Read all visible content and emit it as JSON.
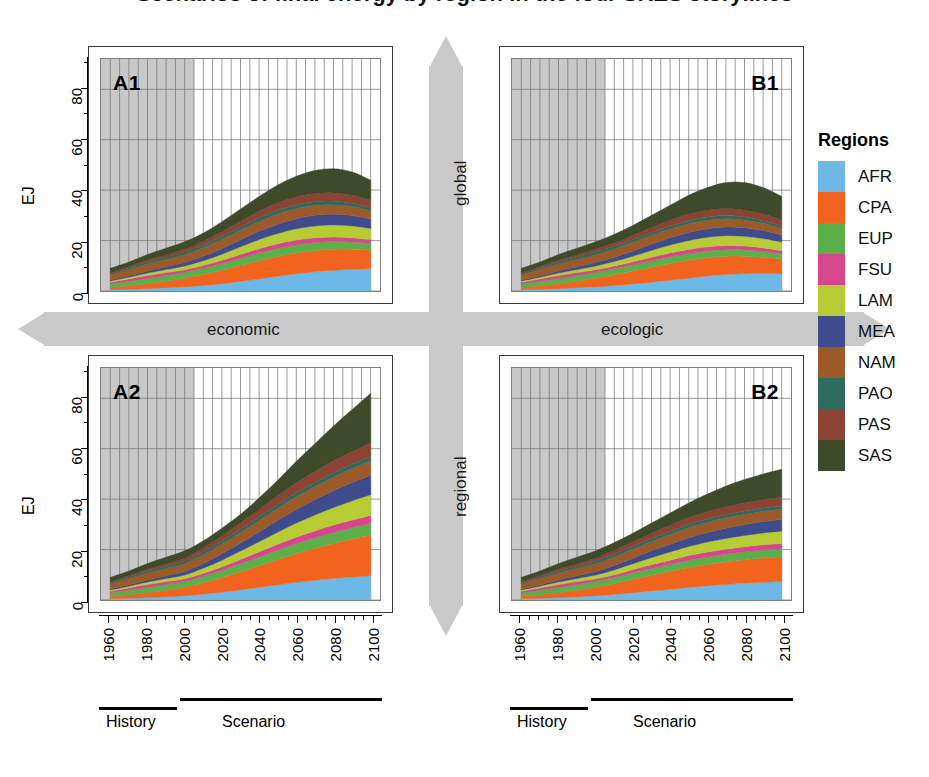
{
  "figure": {
    "title_cropped": "Scenarios of final energy by region in the four SRES storylines",
    "y_axis_label": "EJ",
    "y_ticks": [
      0,
      20,
      40,
      60,
      80
    ],
    "y_minor_ticks": [
      10,
      30,
      50,
      70,
      90
    ],
    "y_range": [
      0,
      92
    ],
    "x_ticks": [
      "1960",
      "1980",
      "2000",
      "2020",
      "2040",
      "2060",
      "2080",
      "2100"
    ],
    "x_range": [
      1955,
      2105
    ],
    "history_end_year": 2005,
    "period_labels": {
      "history": "History",
      "scenario": "Scenario"
    }
  },
  "axes_arrows": {
    "horizontal_left": "economic",
    "horizontal_right": "ecologic",
    "vertical_top": "global",
    "vertical_bottom": "regional",
    "arrow_color": "#c9c9c9"
  },
  "legend": {
    "title": "Regions",
    "items": [
      {
        "code": "AFR",
        "color": "#6cb8e6"
      },
      {
        "code": "CPA",
        "color": "#f2641e"
      },
      {
        "code": "EUP",
        "color": "#5cae48"
      },
      {
        "code": "FSU",
        "color": "#d6468c"
      },
      {
        "code": "LAM",
        "color": "#b7cc34"
      },
      {
        "code": "MEA",
        "color": "#3e4c8e"
      },
      {
        "code": "NAM",
        "color": "#9c5a2a"
      },
      {
        "code": "PAO",
        "color": "#2d6b5e"
      },
      {
        "code": "PAS",
        "color": "#8b4433"
      },
      {
        "code": "SAS",
        "color": "#3f4a2a"
      }
    ]
  },
  "panels": [
    {
      "id": "A1",
      "label": "A1",
      "position": "top-left"
    },
    {
      "id": "B1",
      "label": "B1",
      "position": "top-right"
    },
    {
      "id": "A2",
      "label": "A2",
      "position": "bottom-left"
    },
    {
      "id": "B2",
      "label": "B2",
      "position": "bottom-right"
    }
  ],
  "chart_data": {
    "type": "area",
    "xlabel": "",
    "ylabel": "EJ",
    "ylim": [
      0,
      92
    ],
    "xlim": [
      1955,
      2105
    ],
    "grid": true,
    "legend_position": "right",
    "stacked": true,
    "x": [
      1960,
      1970,
      1980,
      1990,
      2000,
      2010,
      2020,
      2030,
      2040,
      2050,
      2060,
      2070,
      2080,
      2090,
      2100
    ],
    "region_order": [
      "AFR",
      "CPA",
      "EUP",
      "FSU",
      "LAM",
      "MEA",
      "NAM",
      "PAO",
      "PAS",
      "SAS"
    ],
    "panels": [
      {
        "id": "A1",
        "label": "A1",
        "scenario_axes": {
          "x": "economic",
          "y": "global"
        },
        "total_values": [
          9.0,
          11.5,
          14.5,
          17.0,
          19.5,
          23.0,
          27.5,
          32.5,
          37.5,
          42.0,
          45.5,
          47.8,
          48.5,
          47.2,
          44.0
        ],
        "series": [
          {
            "name": "AFR",
            "values": [
              0.5,
              0.7,
              1.0,
              1.3,
              1.7,
              2.2,
              2.9,
              3.8,
              4.8,
              5.8,
              6.8,
              7.6,
              8.2,
              8.6,
              8.8
            ]
          },
          {
            "name": "CPA",
            "values": [
              1.0,
              1.4,
              1.9,
              2.6,
              3.4,
              4.3,
              5.3,
              6.3,
              7.2,
              7.9,
              8.3,
              8.5,
              8.4,
              8.0,
              7.4
            ]
          },
          {
            "name": "EUP",
            "values": [
              1.4,
              1.8,
              2.1,
              2.2,
              2.3,
              2.5,
              2.7,
              2.9,
              3.1,
              3.2,
              3.2,
              3.1,
              3.0,
              2.8,
              2.6
            ]
          },
          {
            "name": "FSU",
            "values": [
              0.6,
              0.9,
              1.1,
              1.2,
              1.0,
              1.1,
              1.3,
              1.5,
              1.7,
              1.8,
              1.9,
              1.9,
              1.8,
              1.7,
              1.6
            ]
          },
          {
            "name": "LAM",
            "values": [
              0.5,
              0.7,
              1.0,
              1.2,
              1.5,
              1.9,
              2.4,
              3.0,
              3.6,
              4.1,
              4.5,
              4.7,
              4.8,
              4.7,
              4.4
            ]
          },
          {
            "name": "MEA",
            "values": [
              0.3,
              0.5,
              0.8,
              1.1,
              1.4,
              1.8,
              2.3,
              2.8,
              3.3,
              3.7,
              4.0,
              4.2,
              4.2,
              4.1,
              3.8
            ]
          },
          {
            "name": "NAM",
            "values": [
              2.2,
              2.6,
              2.9,
              3.0,
              3.2,
              3.4,
              3.6,
              3.8,
              3.9,
              4.0,
              4.0,
              3.9,
              3.8,
              3.6,
              3.3
            ]
          },
          {
            "name": "PAO",
            "values": [
              0.4,
              0.6,
              0.8,
              0.9,
              1.0,
              1.1,
              1.2,
              1.3,
              1.4,
              1.5,
              1.5,
              1.5,
              1.4,
              1.3,
              1.2
            ]
          },
          {
            "name": "PAS",
            "values": [
              0.3,
              0.5,
              0.7,
              0.9,
              1.2,
              1.5,
              1.9,
              2.3,
              2.7,
              3.0,
              3.2,
              3.3,
              3.3,
              3.2,
              3.0
            ]
          },
          {
            "name": "SAS",
            "values": [
              1.8,
              1.8,
              2.2,
              2.6,
              2.8,
              3.2,
              3.9,
              4.8,
              5.8,
              7.0,
              8.1,
              9.1,
              9.6,
              9.2,
              7.9
            ]
          }
        ]
      },
      {
        "id": "B1",
        "label": "B1",
        "scenario_axes": {
          "x": "ecologic",
          "y": "global"
        },
        "total_values": [
          9.0,
          11.5,
          14.5,
          17.0,
          19.5,
          22.5,
          26.0,
          30.0,
          34.0,
          38.0,
          41.0,
          43.0,
          43.0,
          41.0,
          37.5
        ],
        "series": [
          {
            "name": "AFR",
            "values": [
              0.5,
              0.7,
              1.0,
              1.3,
              1.7,
              2.2,
              2.8,
              3.5,
              4.3,
              5.1,
              5.9,
              6.5,
              6.8,
              6.9,
              6.8
            ]
          },
          {
            "name": "CPA",
            "values": [
              1.0,
              1.4,
              1.9,
              2.6,
              3.4,
              4.2,
              5.1,
              5.9,
              6.6,
              7.1,
              7.3,
              7.3,
              7.0,
              6.5,
              5.8
            ]
          },
          {
            "name": "EUP",
            "values": [
              1.4,
              1.8,
              2.1,
              2.2,
              2.3,
              2.4,
              2.5,
              2.6,
              2.7,
              2.7,
              2.7,
              2.6,
              2.5,
              2.3,
              2.1
            ]
          },
          {
            "name": "FSU",
            "values": [
              0.6,
              0.9,
              1.1,
              1.2,
              1.0,
              1.1,
              1.2,
              1.4,
              1.5,
              1.6,
              1.6,
              1.6,
              1.5,
              1.4,
              1.3
            ]
          },
          {
            "name": "LAM",
            "values": [
              0.5,
              0.7,
              1.0,
              1.2,
              1.5,
              1.8,
              2.2,
              2.7,
              3.1,
              3.5,
              3.8,
              3.9,
              3.9,
              3.7,
              3.4
            ]
          },
          {
            "name": "MEA",
            "values": [
              0.3,
              0.5,
              0.8,
              1.1,
              1.4,
              1.7,
              2.1,
              2.5,
              2.9,
              3.2,
              3.4,
              3.5,
              3.4,
              3.2,
              2.9
            ]
          },
          {
            "name": "NAM",
            "values": [
              2.2,
              2.6,
              2.9,
              3.0,
              3.2,
              3.3,
              3.4,
              3.5,
              3.5,
              3.5,
              3.4,
              3.3,
              3.1,
              2.9,
              2.6
            ]
          },
          {
            "name": "PAO",
            "values": [
              0.4,
              0.6,
              0.8,
              0.9,
              1.0,
              1.0,
              1.1,
              1.1,
              1.2,
              1.2,
              1.2,
              1.2,
              1.1,
              1.0,
              0.9
            ]
          },
          {
            "name": "PAS",
            "values": [
              0.3,
              0.5,
              0.7,
              0.9,
              1.2,
              1.4,
              1.7,
              2.0,
              2.3,
              2.6,
              2.7,
              2.8,
              2.7,
              2.6,
              2.3
            ]
          },
          {
            "name": "SAS",
            "values": [
              1.8,
              1.8,
              2.2,
              2.6,
              2.8,
              3.4,
              3.9,
              4.8,
              5.9,
              7.5,
              9.0,
              10.3,
              11.0,
              10.5,
              9.4
            ]
          }
        ]
      },
      {
        "id": "A2",
        "label": "A2",
        "scenario_axes": {
          "x": "economic",
          "y": "regional"
        },
        "total_values": [
          9.0,
          11.5,
          14.5,
          17.0,
          19.5,
          23.5,
          28.5,
          34.0,
          40.5,
          47.5,
          55.0,
          62.0,
          69.0,
          75.5,
          82.0
        ],
        "series": [
          {
            "name": "AFR",
            "values": [
              0.5,
              0.7,
              1.0,
              1.3,
              1.7,
              2.3,
              3.1,
              4.0,
              5.0,
              6.0,
              7.0,
              7.8,
              8.5,
              9.1,
              9.6
            ]
          },
          {
            "name": "CPA",
            "values": [
              1.0,
              1.4,
              1.9,
              2.6,
              3.4,
              4.5,
              5.8,
              7.2,
              8.6,
              10.0,
              11.4,
              12.7,
              13.9,
              15.1,
              16.2
            ]
          },
          {
            "name": "EUP",
            "values": [
              1.4,
              1.8,
              2.1,
              2.2,
              2.3,
              2.6,
              2.9,
              3.2,
              3.5,
              3.8,
              4.0,
              4.2,
              4.4,
              4.5,
              4.6
            ]
          },
          {
            "name": "FSU",
            "values": [
              0.6,
              0.9,
              1.1,
              1.2,
              1.0,
              1.2,
              1.4,
              1.7,
              2.0,
              2.3,
              2.5,
              2.7,
              2.9,
              3.0,
              3.1
            ]
          },
          {
            "name": "LAM",
            "values": [
              0.5,
              0.7,
              1.0,
              1.2,
              1.5,
              2.0,
              2.6,
              3.3,
              4.0,
              4.8,
              5.6,
              6.3,
              7.0,
              7.6,
              8.2
            ]
          },
          {
            "name": "MEA",
            "values": [
              0.3,
              0.5,
              0.8,
              1.1,
              1.4,
              1.9,
              2.5,
              3.2,
              3.9,
              4.7,
              5.4,
              6.1,
              6.7,
              7.3,
              7.8
            ]
          },
          {
            "name": "NAM",
            "values": [
              2.2,
              2.6,
              2.9,
              3.0,
              3.2,
              3.5,
              3.9,
              4.2,
              4.5,
              4.8,
              5.0,
              5.2,
              5.4,
              5.5,
              5.6
            ]
          },
          {
            "name": "PAO",
            "values": [
              0.4,
              0.6,
              0.8,
              0.9,
              1.0,
              1.1,
              1.2,
              1.3,
              1.4,
              1.5,
              1.6,
              1.6,
              1.7,
              1.7,
              1.8
            ]
          },
          {
            "name": "PAS",
            "values": [
              0.3,
              0.5,
              0.7,
              0.9,
              1.2,
              1.6,
              2.0,
              2.5,
              3.0,
              3.5,
              4.0,
              4.4,
              4.8,
              5.1,
              5.4
            ]
          },
          {
            "name": "SAS",
            "values": [
              1.8,
              1.8,
              2.2,
              2.6,
              2.8,
              2.8,
              3.1,
              3.4,
              4.6,
              6.1,
              8.5,
              11.0,
              13.7,
              16.6,
              19.7
            ]
          }
        ]
      },
      {
        "id": "B2",
        "label": "B2",
        "scenario_axes": {
          "x": "ecologic",
          "y": "regional"
        },
        "total_values": [
          9.0,
          11.5,
          14.5,
          17.0,
          19.5,
          22.8,
          26.5,
          30.5,
          34.5,
          38.5,
          42.0,
          45.2,
          47.8,
          50.0,
          51.8
        ],
        "series": [
          {
            "name": "AFR",
            "values": [
              0.5,
              0.7,
              1.0,
              1.3,
              1.7,
              2.2,
              2.9,
              3.6,
              4.3,
              5.0,
              5.6,
              6.1,
              6.6,
              7.0,
              7.3
            ]
          },
          {
            "name": "CPA",
            "values": [
              1.0,
              1.4,
              1.9,
              2.6,
              3.4,
              4.3,
              5.3,
              6.2,
              7.1,
              7.9,
              8.5,
              9.0,
              9.4,
              9.7,
              9.9
            ]
          },
          {
            "name": "EUP",
            "values": [
              1.4,
              1.8,
              2.1,
              2.2,
              2.3,
              2.4,
              2.6,
              2.7,
              2.8,
              2.9,
              3.0,
              3.0,
              3.1,
              3.1,
              3.1
            ]
          },
          {
            "name": "FSU",
            "values": [
              0.6,
              0.9,
              1.1,
              1.2,
              1.0,
              1.1,
              1.3,
              1.5,
              1.6,
              1.8,
              1.9,
              2.0,
              2.0,
              2.1,
              2.1
            ]
          },
          {
            "name": "LAM",
            "values": [
              0.5,
              0.7,
              1.0,
              1.2,
              1.5,
              1.9,
              2.3,
              2.8,
              3.2,
              3.6,
              4.0,
              4.3,
              4.5,
              4.7,
              4.9
            ]
          },
          {
            "name": "MEA",
            "values": [
              0.3,
              0.5,
              0.8,
              1.1,
              1.4,
              1.8,
              2.2,
              2.7,
              3.1,
              3.5,
              3.8,
              4.1,
              4.3,
              4.5,
              4.6
            ]
          },
          {
            "name": "NAM",
            "values": [
              2.2,
              2.6,
              2.9,
              3.0,
              3.2,
              3.4,
              3.6,
              3.7,
              3.9,
              4.0,
              4.0,
              4.1,
              4.1,
              4.1,
              4.1
            ]
          },
          {
            "name": "PAO",
            "values": [
              0.4,
              0.6,
              0.8,
              0.9,
              1.0,
              1.1,
              1.1,
              1.2,
              1.2,
              1.3,
              1.3,
              1.3,
              1.3,
              1.3,
              1.3
            ]
          },
          {
            "name": "PAS",
            "values": [
              0.3,
              0.5,
              0.7,
              0.9,
              1.2,
              1.5,
              1.8,
              2.1,
              2.4,
              2.7,
              2.9,
              3.1,
              3.2,
              3.3,
              3.4
            ]
          },
          {
            "name": "SAS",
            "values": [
              1.8,
              1.8,
              2.2,
              2.6,
              2.8,
              3.1,
              3.4,
              4.0,
              4.9,
              5.8,
              7.0,
              8.2,
              9.3,
              10.2,
              11.1
            ]
          }
        ]
      }
    ]
  }
}
